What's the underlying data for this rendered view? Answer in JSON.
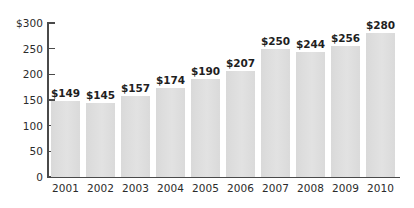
{
  "chart_data": {
    "type": "bar",
    "title": "",
    "subtitle": "",
    "xlabel": "",
    "ylabel": "",
    "categories": [
      "2001",
      "2002",
      "2003",
      "2004",
      "2005",
      "2006",
      "2007",
      "2008",
      "2009",
      "2010"
    ],
    "values": [
      149,
      145,
      157,
      174,
      190,
      207,
      250,
      244,
      256,
      280
    ],
    "value_labels": [
      "$149",
      "$145",
      "$157",
      "$174",
      "$190",
      "$207",
      "$250",
      "$244",
      "$256",
      "$280"
    ],
    "ylim": [
      0,
      300
    ],
    "ytick_values": [
      0,
      50,
      100,
      150,
      200,
      250,
      300
    ],
    "ytick_labels": [
      "0",
      "50",
      "100",
      "150",
      "200",
      "250",
      "$300"
    ],
    "grid": false,
    "legend": null,
    "series": [
      {
        "name": "",
        "values": [
          149,
          145,
          157,
          174,
          190,
          207,
          250,
          244,
          256,
          280
        ]
      }
    ],
    "colors": {
      "bar_fill": "#dcdcdc",
      "axis": "#4a4a4a",
      "text": "#2b2b2b",
      "background": "#ffffff"
    }
  }
}
